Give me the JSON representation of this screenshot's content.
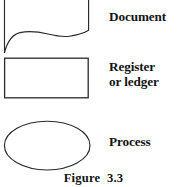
{
  "figure": {
    "caption": "Figure  3.3",
    "background_color": "#ffffff",
    "stroke_color": "#2a2a2a",
    "text_color": "#141414"
  },
  "symbols": [
    {
      "id": "document",
      "icon_name": "document-shape-icon",
      "label": "Document",
      "shape": "document",
      "description": "Rectangle with wavy bottom edge, top cropped by image border",
      "bounds": {
        "x": 4,
        "y": 0,
        "width": 86,
        "height": 53
      }
    },
    {
      "id": "register-or-ledger",
      "icon_name": "rectangle-shape-icon",
      "label": "Register\nor ledger",
      "label_lines": [
        "Register",
        "or ledger"
      ],
      "shape": "rectangle",
      "description": "Plain rectangle",
      "bounds": {
        "x": 4,
        "y": 58,
        "width": 84,
        "height": 40
      }
    },
    {
      "id": "process",
      "icon_name": "ellipse-shape-icon",
      "label": "Process",
      "shape": "ellipse",
      "description": "Horizontal ellipse",
      "bounds": {
        "x": 4,
        "y": 121,
        "width": 86,
        "height": 49
      }
    }
  ]
}
